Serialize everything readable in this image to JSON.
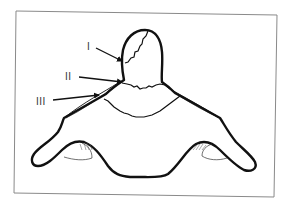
{
  "diagram": {
    "type": "line-drawing",
    "frame": {
      "color": "#8a8a8a"
    },
    "outline_color": "#111111",
    "labels": [
      {
        "id": "I",
        "text": "I"
      },
      {
        "id": "II",
        "text": "II"
      },
      {
        "id": "III",
        "text": "III"
      }
    ]
  }
}
